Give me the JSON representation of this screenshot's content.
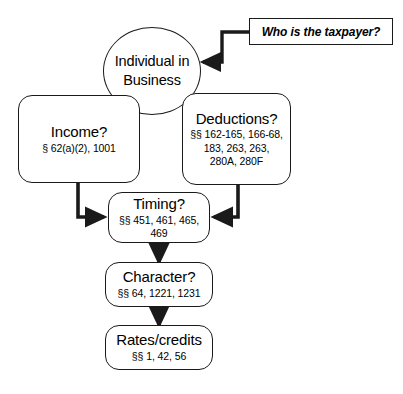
{
  "diagram": {
    "background_color": "#ffffff",
    "line_color": "#1a1a1a",
    "nodes": {
      "root": {
        "shape": "circle",
        "title": "Individual in Business"
      },
      "income": {
        "shape": "rounded-rect",
        "title": "Income?",
        "cites": "§ 62(a)(2), 1001"
      },
      "deductions": {
        "shape": "rounded-rect",
        "title": "Deductions?",
        "cites_line1": "§§ 162-165, 166-68,",
        "cites_line2": "183, 263, 263,",
        "cites_line3": "280A, 280F"
      },
      "timing": {
        "shape": "rounded-rect",
        "title": "Timing?",
        "cites_line1": "§§ 451, 461, 465,",
        "cites_line2": "469"
      },
      "character": {
        "shape": "rounded-rect",
        "title": "Character?",
        "cites": "§§ 64, 1221, 1231"
      },
      "rates": {
        "shape": "rounded-rect",
        "title": "Rates/credits",
        "cites": "§§ 1, 42, 56"
      },
      "callout": {
        "shape": "rect",
        "text": "Who is the taxpayer?"
      }
    },
    "edges": [
      {
        "name": "callout-to-root",
        "from": "callout",
        "to": "root",
        "style": "elbow-arrow"
      },
      {
        "name": "income-to-timing",
        "from": "income",
        "to": "timing",
        "style": "elbow-arrow"
      },
      {
        "name": "deductions-to-timing",
        "from": "deductions",
        "to": "timing",
        "style": "elbow-arrow"
      },
      {
        "name": "timing-to-character",
        "from": "timing",
        "to": "character",
        "style": "straight-arrow"
      },
      {
        "name": "character-to-rates",
        "from": "character",
        "to": "rates",
        "style": "straight-arrow"
      }
    ]
  }
}
